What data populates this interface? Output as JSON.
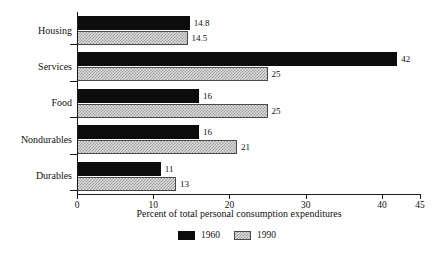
{
  "chart_data": {
    "type": "bar",
    "orientation": "horizontal",
    "title": "",
    "xlabel": "Percent of total personal consumption expenditures",
    "ylabel": "",
    "xlim": [
      0,
      45
    ],
    "xticks": [
      0,
      10,
      20,
      30,
      40,
      45
    ],
    "xtick_labels": [
      "0",
      "10",
      "20",
      "30",
      "40",
      "45"
    ],
    "grid": false,
    "legend_position": "bottom-center",
    "categories": [
      "Housing",
      "Services",
      "Food",
      "Nondurables",
      "Durables"
    ],
    "series": [
      {
        "name": "1960",
        "color": "#0d0d0d",
        "values": [
          14.8,
          42,
          16,
          16,
          11
        ],
        "labels": [
          "14.8",
          "42",
          "16",
          "16",
          "11"
        ]
      },
      {
        "name": "1990",
        "color": "#dcdcdc",
        "values": [
          14.5,
          25,
          25,
          21,
          13
        ],
        "labels": [
          "14.5",
          "25",
          "25",
          "21",
          "13"
        ]
      }
    ]
  },
  "axis": {
    "title": "Percent of total personal consumption expenditures",
    "ticks": [
      {
        "value": 0,
        "label": "0"
      },
      {
        "value": 10,
        "label": "10"
      },
      {
        "value": 20,
        "label": "20"
      },
      {
        "value": 30,
        "label": "30"
      },
      {
        "value": 40,
        "label": "40"
      },
      {
        "value": 45,
        "label": "45"
      }
    ]
  },
  "categories": [
    {
      "label": "Housing"
    },
    {
      "label": "Services"
    },
    {
      "label": "Food"
    },
    {
      "label": "Nondurables"
    },
    {
      "label": "Durables"
    }
  ],
  "legend": {
    "items": [
      {
        "label": "1960",
        "style": "s1960"
      },
      {
        "label": "1990",
        "style": "s1990"
      }
    ]
  }
}
